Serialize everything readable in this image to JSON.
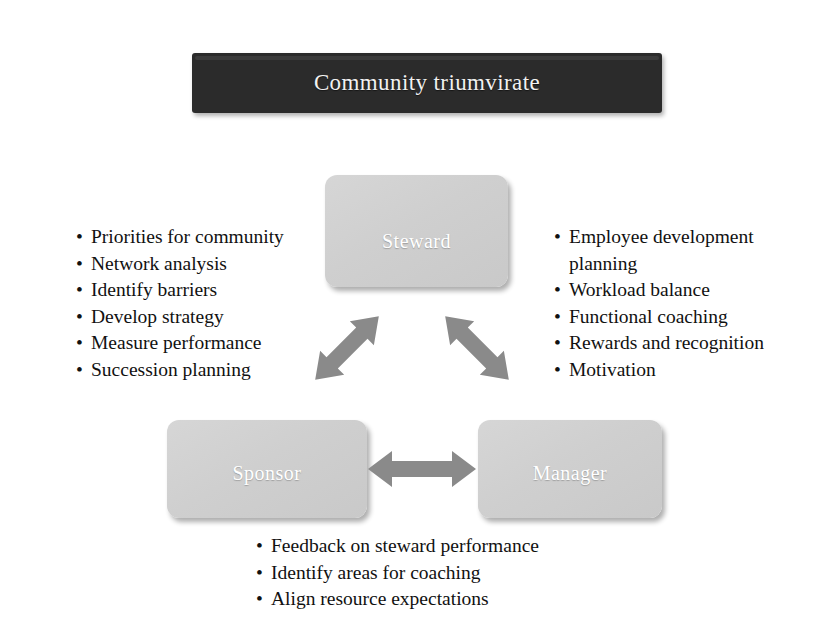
{
  "banner": {
    "title": "Community triumvirate",
    "background_color": "#2b2b2b",
    "text_color": "#f2f2f2"
  },
  "nodes": {
    "steward": {
      "label": "Steward"
    },
    "sponsor": {
      "label": "Sponsor"
    },
    "manager": {
      "label": "Manager"
    }
  },
  "connectors": {
    "steward_sponsor": {
      "name": "steward-sponsor-arrow",
      "style": "double-headed",
      "orientation": "diagonal-down-left"
    },
    "steward_manager": {
      "name": "steward-manager-arrow",
      "style": "double-headed",
      "orientation": "diagonal-down-right"
    },
    "sponsor_manager": {
      "name": "sponsor-manager-arrow",
      "style": "double-headed",
      "orientation": "horizontal"
    },
    "color": "#8a8a8a"
  },
  "lists": {
    "sponsor_duties": [
      "Priorities for community",
      "Network analysis",
      "Identify barriers",
      "Develop strategy",
      "Measure performance",
      "Succession planning"
    ],
    "manager_duties": [
      "Employee development planning",
      "Workload balance",
      "Functional coaching",
      "Rewards and recognition",
      "Motivation"
    ],
    "shared_duties": [
      "Feedback on steward performance",
      "Identify areas for coaching",
      "Align resource expectations"
    ]
  },
  "palette": {
    "page_background": "#ffffff",
    "box_fill": "#d0d0d0",
    "box_label": "#ffffff",
    "text": "#111111"
  }
}
